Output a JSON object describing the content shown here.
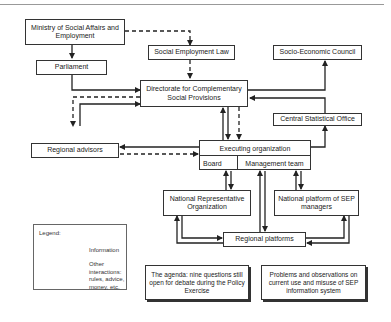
{
  "header": {
    "caption": ""
  },
  "nodes": {
    "ministry": "Ministry of Social Affairs and Employment",
    "social_employment_law": "Social Employment Law",
    "socio_economic_council": "Socio-Economic Council",
    "parliament": "Parliament",
    "directorate": "Directorate for Complementary Social Provisions",
    "central_statistical_office": "Central Statistical Office",
    "regional_advisors": "Regional advisors",
    "executing_organization": "Executing organization",
    "board": "Board",
    "management_team": "Management team",
    "national_representative_organization": "National Representative Organization",
    "national_platform_sep": "National platform of SEP managers",
    "regional_platforms": "Regional platforms"
  },
  "legend": {
    "title": "Legend:",
    "information": "Information",
    "other": "Other interactions: rules, advice, money, etc."
  },
  "notes": {
    "agenda": "The agenda: nine questions still open for debate during the Policy Exercise",
    "problems": "Problems and observations on current use and misuse of SEP information system"
  },
  "edges": [
    {
      "from": "ministry",
      "to": "parliament",
      "type": "information"
    },
    {
      "from": "ministry",
      "to": "social_employment_law",
      "type": "other"
    },
    {
      "from": "social_employment_law",
      "to": "directorate",
      "type": "other"
    },
    {
      "from": "parliament",
      "to": "directorate",
      "type": "information"
    },
    {
      "from": "directorate",
      "to": "socio_economic_council",
      "type": "information"
    },
    {
      "from": "central_statistical_office",
      "to": "directorate",
      "type": "information"
    },
    {
      "from": "directorate",
      "to": "regional_advisors",
      "type": "other"
    },
    {
      "from": "regional_advisors",
      "to": "directorate",
      "type": "information"
    },
    {
      "from": "executing_organization",
      "to": "directorate",
      "type": "information"
    },
    {
      "from": "directorate",
      "to": "executing_organization",
      "type": "information"
    },
    {
      "from": "directorate",
      "to": "executing_organization",
      "type": "other"
    },
    {
      "from": "executing_organization",
      "to": "central_statistical_office",
      "type": "information"
    },
    {
      "from": "executing_organization",
      "to": "regional_advisors",
      "type": "information"
    },
    {
      "from": "regional_advisors",
      "to": "executing_organization",
      "type": "other"
    },
    {
      "from": "national_representative_organization",
      "to": "board",
      "type": "information"
    },
    {
      "from": "board",
      "to": "national_representative_organization",
      "type": "information"
    },
    {
      "from": "regional_platforms",
      "to": "management_team",
      "type": "information"
    },
    {
      "from": "management_team",
      "to": "regional_platforms",
      "type": "information"
    },
    {
      "from": "national_platform_sep",
      "to": "management_team",
      "type": "information"
    },
    {
      "from": "management_team",
      "to": "national_platform_sep",
      "type": "information"
    },
    {
      "from": "regional_platforms",
      "to": "national_representative_organization",
      "type": "information"
    },
    {
      "from": "national_representative_organization",
      "to": "regional_platforms",
      "type": "information"
    },
    {
      "from": "regional_platforms",
      "to": "national_platform_sep",
      "type": "information"
    },
    {
      "from": "national_platform_sep",
      "to": "regional_platforms",
      "type": "information"
    }
  ]
}
